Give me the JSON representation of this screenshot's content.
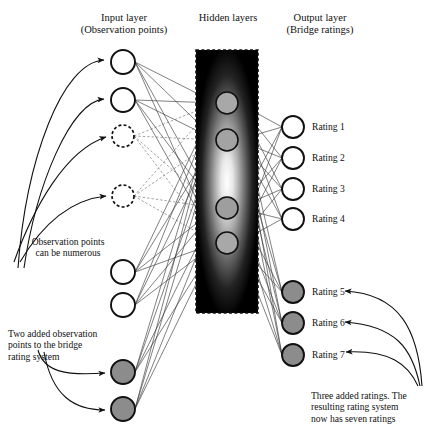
{
  "diagram": {
    "type": "neural-network",
    "headers": {
      "input": "Input layer",
      "input_sub": "(Observation points)",
      "hidden": "Hidden layers",
      "output": "Output layer",
      "output_sub": "(Bridge ratings)"
    },
    "annotations": {
      "observation": "Observation points\ncan be numerous",
      "observation_line1": "Observation points",
      "observation_line2": "can be numerous",
      "added_inputs_line1": "Two added observation",
      "added_inputs_line2": "points to the bridge",
      "added_inputs_line3": "rating system",
      "added_ratings_line1": "Three added ratings. The",
      "added_ratings_line2": "resulting rating system",
      "added_ratings_line3": "now has seven ratings"
    },
    "colors": {
      "stroke": "#111111",
      "node_fill_empty": "#ffffff",
      "node_fill_added": "#8c8c8c",
      "hidden_node_fill": "#a8a8a8",
      "hidden_block": "#000000",
      "hidden_glow": "#ffffff",
      "edge": "#2b2b2b"
    },
    "input_nodes": [
      {
        "id": "input-1",
        "cx": 123,
        "cy": 62,
        "r": 12,
        "style": "solid",
        "fill": "white"
      },
      {
        "id": "input-2",
        "cx": 123,
        "cy": 100,
        "r": 12,
        "style": "solid",
        "fill": "white"
      },
      {
        "id": "input-3",
        "cx": 123,
        "cy": 136,
        "r": 11,
        "style": "dashed",
        "fill": "white"
      },
      {
        "id": "input-4",
        "cx": 123,
        "cy": 196,
        "r": 11,
        "style": "dashed",
        "fill": "white"
      },
      {
        "id": "input-5",
        "cx": 123,
        "cy": 272,
        "r": 12,
        "style": "solid",
        "fill": "white"
      },
      {
        "id": "input-6",
        "cx": 123,
        "cy": 305,
        "r": 12,
        "style": "solid",
        "fill": "white"
      },
      {
        "id": "input-7",
        "cx": 123,
        "cy": 372,
        "r": 12,
        "style": "solid",
        "fill": "gray"
      },
      {
        "id": "input-8",
        "cx": 123,
        "cy": 409,
        "r": 12,
        "style": "solid",
        "fill": "gray"
      }
    ],
    "hidden_block": {
      "x": 196,
      "y": 50,
      "width": 62,
      "height": 263
    },
    "hidden_nodes": [
      {
        "id": "hidden-1",
        "cx": 227,
        "cy": 103,
        "r": 11
      },
      {
        "id": "hidden-2",
        "cx": 227,
        "cy": 140,
        "r": 11
      },
      {
        "id": "hidden-3",
        "cx": 227,
        "cy": 208,
        "r": 11
      },
      {
        "id": "hidden-4",
        "cx": 227,
        "cy": 243,
        "r": 11
      }
    ],
    "output_nodes": [
      {
        "id": "output-1",
        "label": "Rating 1",
        "cx": 293,
        "cy": 127,
        "r": 11,
        "fill": "white"
      },
      {
        "id": "output-2",
        "label": "Rating 2",
        "cx": 293,
        "cy": 158,
        "r": 11,
        "fill": "white"
      },
      {
        "id": "output-3",
        "label": "Rating 3",
        "cx": 293,
        "cy": 189,
        "r": 11,
        "fill": "white"
      },
      {
        "id": "output-4",
        "label": "Rating 4",
        "cx": 293,
        "cy": 219,
        "r": 11,
        "fill": "white"
      },
      {
        "id": "output-5",
        "label": "Rating 5",
        "cx": 293,
        "cy": 292,
        "r": 11,
        "fill": "gray"
      },
      {
        "id": "output-6",
        "label": "Rating 6",
        "cx": 293,
        "cy": 323,
        "r": 11,
        "fill": "gray"
      },
      {
        "id": "output-7",
        "label": "Rating 7",
        "cx": 293,
        "cy": 355,
        "r": 11,
        "fill": "gray"
      }
    ]
  }
}
